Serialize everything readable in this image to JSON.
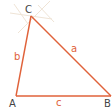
{
  "diagram": {
    "type": "triangle",
    "colors": {
      "side": "#e0623a",
      "side_label": "#e0623a",
      "vertex_label": "#444444",
      "construction": "#efe4d6"
    },
    "vertices": {
      "A": {
        "label": "A",
        "x": 16,
        "y": 96
      },
      "B": {
        "label": "B",
        "x": 111,
        "y": 96
      },
      "C": {
        "label": "C",
        "x": 31,
        "y": 16
      }
    },
    "sides": {
      "a": {
        "label": "a",
        "from": "B",
        "to": "C"
      },
      "b": {
        "label": "b",
        "from": "A",
        "to": "C"
      },
      "c": {
        "label": "c",
        "from": "A",
        "to": "B"
      }
    }
  }
}
